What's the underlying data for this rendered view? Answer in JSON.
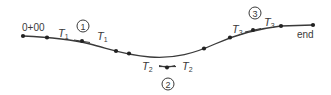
{
  "diagram": {
    "stroke_color": "#3a3a3a",
    "start_label": "0+00",
    "end_label": "end",
    "tangent_labels": {
      "t1": "T",
      "t1_sub": "1",
      "t2": "T",
      "t2_sub": "2",
      "t3": "T",
      "t3_sub": "3"
    },
    "markers": {
      "m1": "1",
      "m2": "2",
      "m3": "3"
    }
  }
}
